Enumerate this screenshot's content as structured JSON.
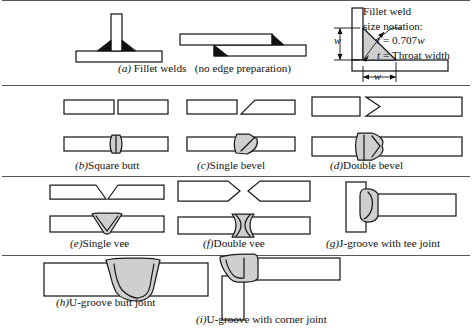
{
  "figure": {
    "title_implicit": "Welded joint types and edge preparations",
    "rows": 4,
    "separator_color": "#585858",
    "plate_fill": "#ffffff",
    "plate_stroke": "#1a1a1a",
    "weld_bead_fill": "#cfcfcf",
    "fillet_fill": "#111111"
  },
  "captions": {
    "a_letter": "(a)",
    "a_text": "Fillet welds",
    "a_text2": "(no edge preparation)",
    "b_letter": "(b)",
    "b_text": "Square butt",
    "c_letter": "(c)",
    "c_text": "Single bevel",
    "d_letter": "(d)",
    "d_text": "Double bevel",
    "e_letter": "(e)",
    "e_text": "Single vee",
    "f_letter": "(f)",
    "f_text": "Double vee",
    "g_letter": "(g)",
    "g_text": "J-groove with tee joint",
    "h_letter": "(h)",
    "h_text": "U-groove butt joint",
    "i_letter": "(i)",
    "i_text": "U-groove with corner joint"
  },
  "notation": {
    "line1": "Fillet weld",
    "line2": "size notation:",
    "equation_var": "t",
    "equation_rest": "=  0.707",
    "equation_w": "w",
    "throat_var": "t",
    "throat_rest": "=  Throat width",
    "dim_vertical": "w",
    "dim_horizontal": "w"
  }
}
